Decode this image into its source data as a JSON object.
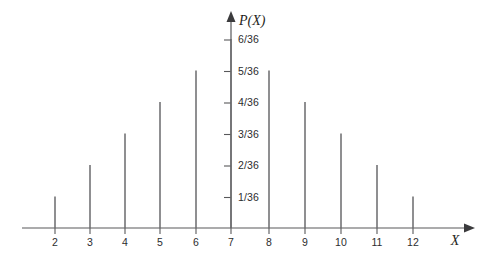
{
  "chart_data": {
    "type": "bar",
    "title": "",
    "subtitle": "",
    "xlabel": "X",
    "ylabel": "P(X)",
    "categories": [
      2,
      3,
      4,
      5,
      6,
      7,
      8,
      9,
      10,
      11,
      12
    ],
    "values": [
      1,
      2,
      3,
      4,
      5,
      6,
      5,
      4,
      3,
      2,
      1
    ],
    "value_labels": [
      "1/36",
      "2/36",
      "3/36",
      "4/36",
      "5/36",
      "6/36",
      "5/36",
      "4/36",
      "3/36",
      "2/36",
      "1/36"
    ],
    "xtick_labels": [
      "2",
      "3",
      "4",
      "5",
      "6",
      "7",
      "8",
      "9",
      "10",
      "11",
      "12"
    ],
    "ytick_values": [
      1,
      2,
      3,
      4,
      5,
      6
    ],
    "ytick_labels": [
      "1/36",
      "2/36",
      "3/36",
      "4/36",
      "5/36",
      "6/36"
    ],
    "xlim": [
      1.5,
      13.2
    ],
    "ylim": [
      0,
      6.8
    ],
    "grid": false,
    "legend": null,
    "annotations": [],
    "axis_arrows": true,
    "series_color": "#6a6a6c",
    "axis_color": "#58585a",
    "text_color": "#2c2c2e",
    "background": "#ffffff"
  },
  "axes": {
    "y_axis_label": "P(X)",
    "x_axis_label": "X"
  }
}
